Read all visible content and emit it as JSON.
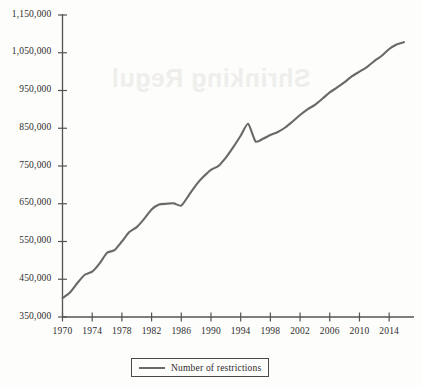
{
  "background_note": {
    "bleed_text": "Shrinking Regul"
  },
  "legend": {
    "label": "Number of restrictions",
    "position": "bottom-center"
  },
  "colors": {
    "line": "#6b6968",
    "axis": "#555352",
    "text": "#2e2c2b",
    "background": "#fdfdfc"
  },
  "chart_data": {
    "type": "line",
    "title": "",
    "subtitle": "",
    "xlabel": "",
    "ylabel": "",
    "grid": false,
    "legend_position": "bottom-center",
    "xlim": [
      1970,
      2016
    ],
    "ylim": [
      350000,
      1150000
    ],
    "ytick_labels": [
      "1,150,000",
      "1,050,000",
      "950,000",
      "850,000",
      "750,000",
      "650,000",
      "550,000",
      "450,000",
      "350,000"
    ],
    "ytick_values": [
      1150000,
      1050000,
      950000,
      850000,
      750000,
      650000,
      550000,
      450000,
      350000
    ],
    "xtick_labels": [
      "1970",
      "1974",
      "1978",
      "1982",
      "1986",
      "1990",
      "1994",
      "1998",
      "2002",
      "2006",
      "2010",
      "2014"
    ],
    "xtick_values": [
      1970,
      1974,
      1978,
      1982,
      1986,
      1990,
      1994,
      1998,
      2002,
      2006,
      2010,
      2014
    ],
    "series": [
      {
        "name": "Number of restrictions",
        "x": [
          1970,
          1971,
          1972,
          1973,
          1974,
          1975,
          1976,
          1977,
          1978,
          1979,
          1980,
          1981,
          1982,
          1983,
          1984,
          1985,
          1986,
          1987,
          1988,
          1989,
          1990,
          1991,
          1992,
          1993,
          1994,
          1995,
          1996,
          1997,
          1998,
          1999,
          2000,
          2001,
          2002,
          2003,
          2004,
          2005,
          2006,
          2007,
          2008,
          2009,
          2010,
          2011,
          2012,
          2013,
          2014,
          2015,
          2016
        ],
        "values": [
          400000,
          415000,
          440000,
          462000,
          470000,
          492000,
          520000,
          527000,
          550000,
          575000,
          588000,
          610000,
          635000,
          648000,
          650000,
          651000,
          645000,
          672000,
          700000,
          722000,
          740000,
          750000,
          772000,
          800000,
          830000,
          862000,
          815000,
          822000,
          832000,
          840000,
          852000,
          868000,
          885000,
          900000,
          912000,
          928000,
          945000,
          958000,
          972000,
          988000,
          1000000,
          1012000,
          1028000,
          1042000,
          1060000,
          1072000,
          1078000
        ]
      }
    ]
  }
}
